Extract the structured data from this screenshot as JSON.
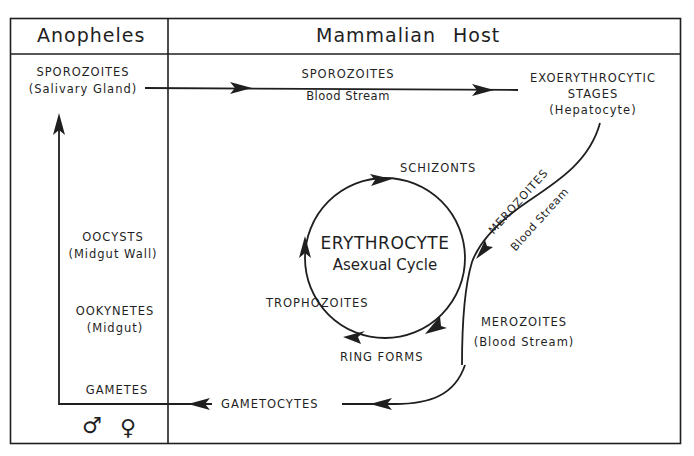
{
  "diagram": {
    "columns": {
      "left_header": "Anopheles",
      "right_header": "Mammalian Host"
    },
    "anopheles_stages": [
      {
        "name": "SPOROZOITES",
        "location": "(Salivary Gland)"
      },
      {
        "name": "OOCYSTS",
        "location": "(Midgut Wall)"
      },
      {
        "name": "OOKYNETES",
        "location": "(Midgut)"
      },
      {
        "name": "GAMETES",
        "location": ""
      }
    ],
    "sex_symbols": {
      "male": "♂",
      "female": "♀"
    },
    "host_stages": {
      "sporozoites_transfer": {
        "name": "SPOROZOITES",
        "location": "Blood Stream"
      },
      "exoerythrocytic": {
        "line1": "EXOERYTHROCYTIC",
        "line2": "STAGES",
        "location": "(Hepatocyte)"
      },
      "merozoites_to_rbc": {
        "name": "MEROZOITES",
        "location": "Blood Stream"
      },
      "erythrocyte_cycle": {
        "title": "ERYTHROCYTE",
        "subtitle": "Asexual Cycle",
        "stages": [
          "SCHIZONTS",
          "TROPHOZOITES",
          "RING FORMS"
        ]
      },
      "merozoites_release": {
        "name": "MEROZOITES",
        "location": "(Blood Stream)"
      },
      "gametocytes": {
        "name": "GAMETOCYTES"
      }
    },
    "colors": {
      "ink": "#1f1f1f",
      "background": "#ffffff"
    }
  }
}
